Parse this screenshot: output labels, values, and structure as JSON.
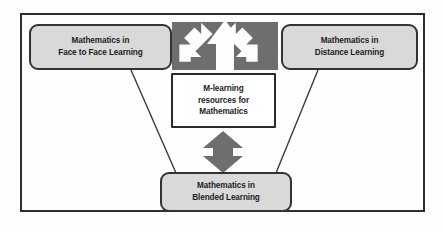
{
  "diagram": {
    "type": "concept-map",
    "background_color": "#fdfdfd",
    "frame_color": "#2e2e2e",
    "node_fill_gray": "#d9d9d9",
    "node_fill_white": "#ffffff",
    "arrow_color": "#6e6e6e",
    "connector_color": "#3a3a3a",
    "nodes": [
      {
        "id": "face-to-face",
        "shape": "rounded-rectangle",
        "fill": "#d9d9d9",
        "line1": "Mathematics in",
        "line2": "Face to Face Learning"
      },
      {
        "id": "distance",
        "shape": "rounded-rectangle",
        "fill": "#d9d9d9",
        "line1": "Mathematics in",
        "line2": "Distance Learning"
      },
      {
        "id": "mlearning",
        "shape": "rectangle",
        "fill": "#ffffff",
        "line1": "M-learning",
        "line2": "resources for",
        "line3": "Mathematics"
      },
      {
        "id": "blended",
        "shape": "rounded-rectangle",
        "fill": "#d9d9d9",
        "line1": "Mathematics in",
        "line2": "Blended Learning"
      }
    ],
    "connectors": [
      {
        "id": "face-to-face-to-blended",
        "style": "thin-line",
        "from": "face-to-face",
        "to": "blended"
      },
      {
        "id": "distance-to-blended",
        "style": "thin-line",
        "from": "distance",
        "to": "blended"
      },
      {
        "id": "mlearning-fan-up",
        "style": "block-arrow-fan",
        "from": "mlearning",
        "to": "face-to-face, up, distance",
        "heads": 3
      },
      {
        "id": "mlearning-to-blended",
        "style": "double-headed-block-arrow",
        "from": "mlearning",
        "to": "blended",
        "heads": 2
      }
    ]
  }
}
